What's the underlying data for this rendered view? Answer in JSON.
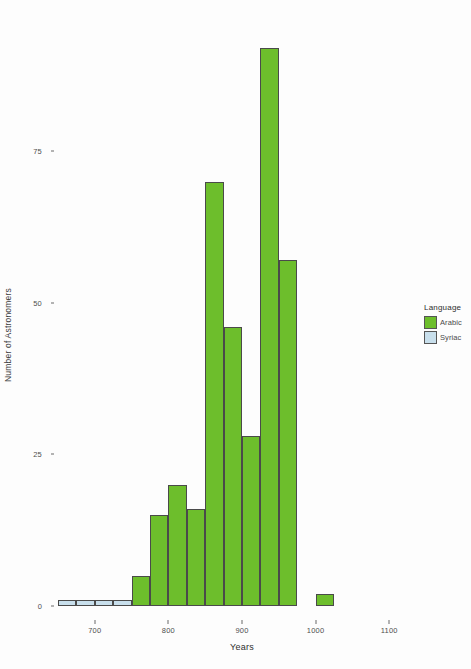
{
  "chart_data": {
    "type": "bar",
    "title": "",
    "subtitle": "",
    "xlabel": "Years",
    "ylabel": "Number of Astronomers",
    "xlim": [
      650,
      1150
    ],
    "ylim": [
      0,
      95
    ],
    "grid": false,
    "bin_width": 25,
    "legend_position": "right",
    "legend_title": "Language",
    "x_ticks": [
      700,
      800,
      900,
      1000,
      1100
    ],
    "x_tick_labels": [
      "700",
      "800",
      "900",
      "1000",
      "1100"
    ],
    "y_ticks": [
      0,
      25,
      50,
      75
    ],
    "y_tick_labels": [
      "0",
      "25",
      "50",
      "75"
    ],
    "series": [
      {
        "name": "Arabic",
        "color": "#6DBE2C",
        "bins": [
          {
            "x0": 750,
            "x1": 775,
            "value": 5
          },
          {
            "x0": 775,
            "x1": 800,
            "value": 15
          },
          {
            "x0": 800,
            "x1": 825,
            "value": 20
          },
          {
            "x0": 825,
            "x1": 850,
            "value": 16
          },
          {
            "x0": 850,
            "x1": 875,
            "value": 70
          },
          {
            "x0": 875,
            "x1": 900,
            "value": 46
          },
          {
            "x0": 900,
            "x1": 925,
            "value": 28
          },
          {
            "x0": 925,
            "x1": 950,
            "value": 92
          },
          {
            "x0": 950,
            "x1": 975,
            "value": 57
          },
          {
            "x0": 1000,
            "x1": 1025,
            "value": 2
          }
        ]
      },
      {
        "name": "Syriac",
        "color": "#C8DFEC",
        "bins": [
          {
            "x0": 650,
            "x1": 675,
            "value": 1
          },
          {
            "x0": 675,
            "x1": 700,
            "value": 1
          },
          {
            "x0": 700,
            "x1": 725,
            "value": 1
          },
          {
            "x0": 725,
            "x1": 750,
            "value": 1
          }
        ]
      }
    ]
  },
  "legend": {
    "title": "Language",
    "entries": [
      {
        "label": "Arabic",
        "color": "#6DBE2C"
      },
      {
        "label": "Syriac",
        "color": "#C8DFEC"
      }
    ]
  },
  "axes": {
    "x_title": "Years",
    "y_title": "Number of Astronomers"
  },
  "colors": {
    "arabic": "#6DBE2C",
    "syriac": "#C8DFEC",
    "bar_outline": "#4a4a4a",
    "background": "#fdfdfd",
    "text": "#3a3a3a"
  }
}
